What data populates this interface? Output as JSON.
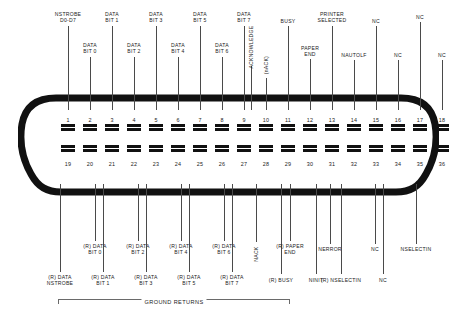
{
  "diagram": {
    "ground_returns_label": "GROUND RETURNS",
    "shell_color": "#111111",
    "pin_color": "#111111",
    "leader_color": "#4a4a4a"
  },
  "top_labels": [
    {
      "text": "NSTROBE\nD0-D7",
      "x": 68,
      "y": 11,
      "line_top": 26,
      "line_bottom": 110
    },
    {
      "text": "DATA\nBIT 0",
      "x": 90,
      "y": 42,
      "line_top": 57,
      "line_bottom": 110
    },
    {
      "text": "DATA\nBIT 1",
      "x": 112,
      "y": 11,
      "line_top": 26,
      "line_bottom": 110
    },
    {
      "text": "DATA\nBIT 2",
      "x": 134,
      "y": 42,
      "line_top": 57,
      "line_bottom": 110
    },
    {
      "text": "DATA\nBIT 3",
      "x": 156,
      "y": 11,
      "line_top": 26,
      "line_bottom": 110
    },
    {
      "text": "DATA\nBIT 4",
      "x": 178,
      "y": 42,
      "line_top": 57,
      "line_bottom": 110
    },
    {
      "text": "DATA\nBIT 5",
      "x": 200,
      "y": 11,
      "line_top": 26,
      "line_bottom": 110
    },
    {
      "text": "DATA\nBIT 6",
      "x": 222,
      "y": 42,
      "line_top": 57,
      "line_bottom": 110
    },
    {
      "text": "DATA\nBIT 7",
      "x": 244,
      "y": 11,
      "line_top": 26,
      "line_bottom": 110
    },
    {
      "text": "BUSY",
      "x": 288,
      "y": 18,
      "line_top": 26,
      "line_bottom": 110
    },
    {
      "text": "PAPER\nEND",
      "x": 310,
      "y": 45,
      "line_top": 59,
      "line_bottom": 110
    },
    {
      "text": "PRINTER\nSELECTED",
      "x": 332,
      "y": 11,
      "line_top": 26,
      "line_bottom": 110
    },
    {
      "text": "NAUTOLF",
      "x": 354,
      "y": 52,
      "line_top": 60,
      "line_bottom": 110
    },
    {
      "text": "NC",
      "x": 376,
      "y": 18,
      "line_top": 26,
      "line_bottom": 110
    },
    {
      "text": "NC",
      "x": 398,
      "y": 52,
      "line_top": 60,
      "line_bottom": 110
    },
    {
      "text": "NC",
      "x": 420,
      "y": 14,
      "line_top": 22,
      "line_bottom": 110
    },
    {
      "text": "NC",
      "x": 442,
      "y": 52,
      "line_top": 60,
      "line_bottom": 110
    }
  ],
  "top_vertical_labels": [
    {
      "text": "ACKNOWLEDGE",
      "x": 251,
      "y": 44,
      "line_top": 66,
      "line_bottom": 110
    },
    {
      "text": "(nACK)",
      "x": 266,
      "y": 62,
      "line_top": 78,
      "line_bottom": 110
    }
  ],
  "bottom_labels": [
    {
      "text": "(R) DATA\nNSTROBE",
      "x": 60,
      "y": 274,
      "line_top": 184,
      "line_bottom": 272
    },
    {
      "text": "(R) DATA\nBIT 0",
      "x": 95,
      "y": 243,
      "line_top": 184,
      "line_bottom": 241
    },
    {
      "text": "(R) DATA\nBIT 1",
      "x": 103,
      "y": 274,
      "line_top": 184,
      "line_bottom": 272
    },
    {
      "text": "(R) DATA\nBIT 2",
      "x": 138,
      "y": 243,
      "line_top": 184,
      "line_bottom": 241
    },
    {
      "text": "(R) DATA\nBIT 3",
      "x": 146,
      "y": 274,
      "line_top": 184,
      "line_bottom": 272
    },
    {
      "text": "(R) DATA\nBIT 4",
      "x": 181,
      "y": 243,
      "line_top": 184,
      "line_bottom": 241
    },
    {
      "text": "(R) DATA\nBIT 5",
      "x": 189,
      "y": 274,
      "line_top": 184,
      "line_bottom": 272
    },
    {
      "text": "(R) DATA\nBIT 6",
      "x": 224,
      "y": 243,
      "line_top": 184,
      "line_bottom": 241
    },
    {
      "text": "(R) DATA\nBIT 7",
      "x": 232,
      "y": 274,
      "line_top": 184,
      "line_bottom": 272
    },
    {
      "text": "(R) BUSY",
      "x": 281,
      "y": 277,
      "line_top": 184,
      "line_bottom": 274
    },
    {
      "text": "(R) PAPER\nEND",
      "x": 290,
      "y": 243,
      "line_top": 184,
      "line_bottom": 241
    },
    {
      "text": "NINIT",
      "x": 316,
      "y": 277,
      "line_top": 184,
      "line_bottom": 274
    },
    {
      "text": "NERROR",
      "x": 330,
      "y": 246,
      "line_top": 184,
      "line_bottom": 244
    },
    {
      "text": "(R) NSELECTIN",
      "x": 341,
      "y": 277,
      "line_top": 184,
      "line_bottom": 274
    },
    {
      "text": "NC",
      "x": 375,
      "y": 246,
      "line_top": 184,
      "line_bottom": 244
    },
    {
      "text": "NC",
      "x": 383,
      "y": 277,
      "line_top": 184,
      "line_bottom": 274
    },
    {
      "text": "NSELECTIN",
      "x": 416,
      "y": 246,
      "line_top": 184,
      "line_bottom": 244
    }
  ],
  "bottom_vertical_labels": [
    {
      "text": "NACK",
      "x": 256,
      "y": 251,
      "line_top": 184,
      "line_bottom": 242
    }
  ],
  "pins": {
    "top_row": {
      "numbers": [
        "1",
        "2",
        "3",
        "4",
        "5",
        "6",
        "7",
        "8",
        "9",
        "10",
        "11",
        "12",
        "13",
        "14",
        "15",
        "16",
        "17",
        "18"
      ],
      "y_number": 117,
      "y_contact": 124
    },
    "bottom_row": {
      "numbers": [
        "19",
        "20",
        "21",
        "22",
        "23",
        "24",
        "25",
        "26",
        "27",
        "28",
        "29",
        "30",
        "31",
        "32",
        "33",
        "34",
        "35",
        "36"
      ],
      "y_contact": 145,
      "y_number": 161
    },
    "x_start": 68,
    "x_step": 22
  }
}
